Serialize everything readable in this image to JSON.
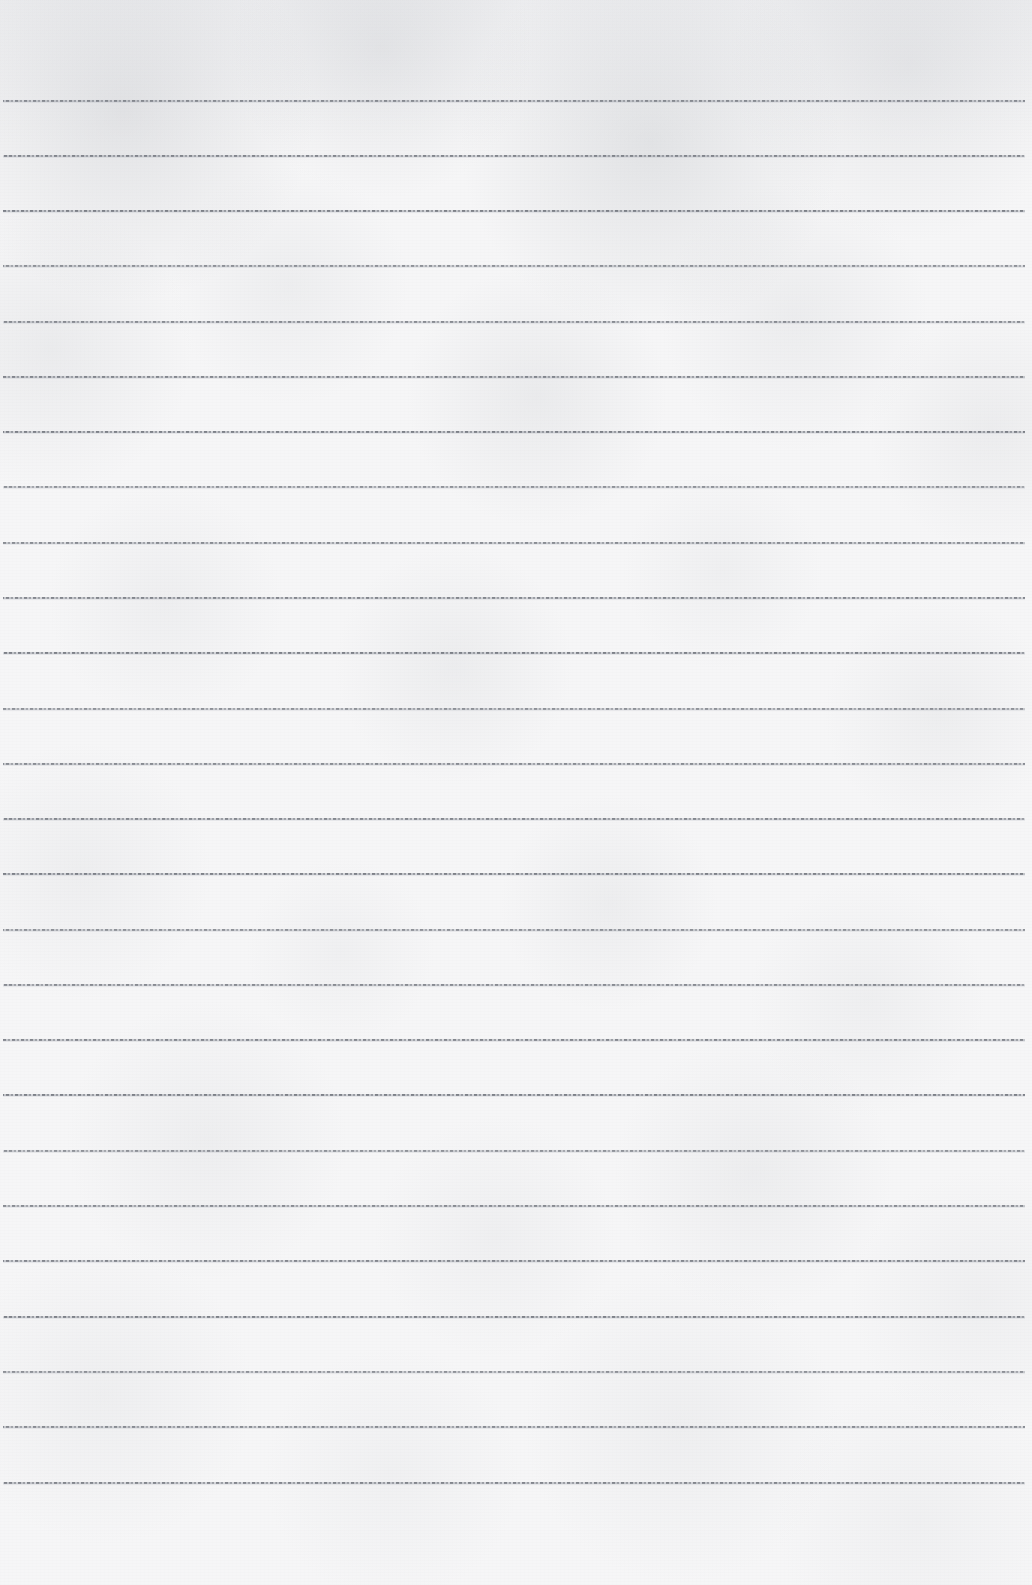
{
  "document": {
    "kind": "lined-notebook-paper",
    "title": "Blank ruled paper sheet",
    "page_width": 1032,
    "page_height": 1585,
    "paper_color": "#f6f6f7",
    "rule_color": "#6c7078",
    "content_text": "",
    "has_written_content": false,
    "has_margin_rule": false
  },
  "ruling": {
    "line_count": 26,
    "first_line_y": 100,
    "last_line_y": 1482,
    "line_spacing": 55.3,
    "line_thickness": 2,
    "line_start_x": 3,
    "line_end_x": 1025,
    "style": "dashed-gray",
    "top_margin": 100,
    "bottom_margin": 103
  },
  "lines": [
    {
      "index": 1,
      "y": 100
    },
    {
      "index": 2,
      "y": 155
    },
    {
      "index": 3,
      "y": 210
    },
    {
      "index": 4,
      "y": 265
    },
    {
      "index": 5,
      "y": 321
    },
    {
      "index": 6,
      "y": 376
    },
    {
      "index": 7,
      "y": 431
    },
    {
      "index": 8,
      "y": 486
    },
    {
      "index": 9,
      "y": 542
    },
    {
      "index": 10,
      "y": 597
    },
    {
      "index": 11,
      "y": 652
    },
    {
      "index": 12,
      "y": 708
    },
    {
      "index": 13,
      "y": 763
    },
    {
      "index": 14,
      "y": 818
    },
    {
      "index": 15,
      "y": 873
    },
    {
      "index": 16,
      "y": 929
    },
    {
      "index": 17,
      "y": 984
    },
    {
      "index": 18,
      "y": 1039
    },
    {
      "index": 19,
      "y": 1094
    },
    {
      "index": 20,
      "y": 1150
    },
    {
      "index": 21,
      "y": 1205
    },
    {
      "index": 22,
      "y": 1260
    },
    {
      "index": 23,
      "y": 1316
    },
    {
      "index": 24,
      "y": 1371
    },
    {
      "index": 25,
      "y": 1426
    },
    {
      "index": 26,
      "y": 1482
    }
  ]
}
